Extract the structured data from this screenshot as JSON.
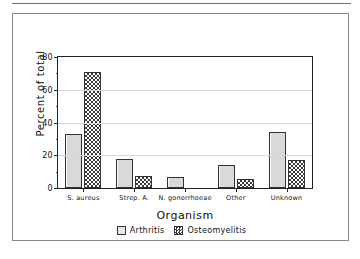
{
  "chart_data": {
    "type": "bar",
    "title": "",
    "xlabel": "Organism",
    "ylabel": "Percent of total",
    "categories": [
      "S. aureus",
      "Strep. A.",
      "N. gonorrhoeae",
      "Other",
      "Unknown"
    ],
    "series": [
      {
        "name": "Arthritis",
        "values": [
          33,
          18,
          7,
          14,
          34
        ]
      },
      {
        "name": "Osteomyelitis",
        "values": [
          71,
          7.5,
          0,
          5.5,
          17
        ]
      }
    ],
    "ylim": [
      0,
      80
    ],
    "yticks": [
      0,
      20,
      40,
      60,
      80
    ],
    "ytick_labels": [
      "0",
      "20",
      "40",
      "60",
      "80"
    ],
    "grid": "horizontal",
    "legend_position": "bottom-center"
  },
  "legend": {
    "items": [
      {
        "label": "Arthritis",
        "swatch": "light-gray-fill"
      },
      {
        "label": "Osteomyelitis",
        "swatch": "checkerboard-fill"
      }
    ]
  },
  "colors": {
    "arthritis_fill": "#d9d9d9",
    "osteomyelitis_fill": "#3a3a3a",
    "axis": "#222222",
    "gridline": "#d8d8d8",
    "panel_border": "#8a8a8a",
    "background": "#ffffff"
  }
}
